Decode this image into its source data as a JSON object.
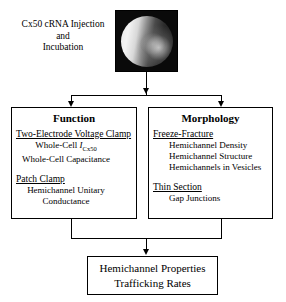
{
  "figure": {
    "top": {
      "caption_lines": [
        "Cx50 cRNA Injection",
        "and",
        "Incubation"
      ],
      "micrograph_name": "oocyte-micrograph"
    },
    "branches": [
      {
        "title": "Function",
        "sections": [
          {
            "heading": "Two-Electrode Voltage Clamp",
            "items": [
              "Whole-Cell I",
              "Whole-Cell Capacitance"
            ],
            "item0_main": "Whole-Cell ",
            "item0_symbol": "I",
            "item0_subscript": "Cx50",
            "item1": "Whole-Cell Capacitance"
          },
          {
            "heading": "Patch Clamp",
            "items": [
              "Hemichannel Unitary",
              "Conductance"
            ]
          }
        ]
      },
      {
        "title": "Morphology",
        "sections": [
          {
            "heading": "Freeze-Fracture",
            "items": [
              "Hemichannel Density",
              "Hemichannel Structure",
              "Hemichannels in Vesicles"
            ]
          },
          {
            "heading": "Thin Section",
            "items": [
              "Gap Junctions"
            ]
          }
        ]
      }
    ],
    "outcome": {
      "lines": [
        "Hemichannel Properties",
        "Trafficking Rates"
      ]
    },
    "colors": {
      "line": "#000000",
      "background": "#ffffff",
      "micrograph_background": "#0a0a0a"
    }
  }
}
